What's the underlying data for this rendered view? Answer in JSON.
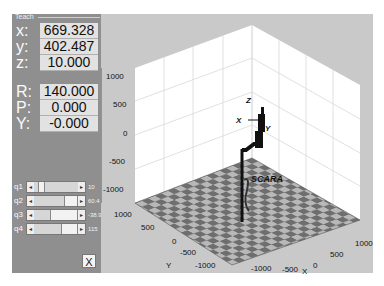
{
  "panel": {
    "title": "Teach",
    "position": [
      {
        "label": "x:",
        "value": "669.328"
      },
      {
        "label": "y:",
        "value": "402.487"
      },
      {
        "label": "z:",
        "value": "10.000"
      }
    ],
    "orientation": [
      {
        "label": "R:",
        "value": "140.000"
      },
      {
        "label": "P:",
        "value": "0.000"
      },
      {
        "label": "Y:",
        "value": "-0.000"
      }
    ],
    "joints": [
      {
        "label": "q1",
        "value": "10",
        "thumb_left": 4,
        "thumb_width": 7
      },
      {
        "label": "q2",
        "value": "60.4",
        "thumb_left": 30,
        "thumb_width": 14
      },
      {
        "label": "q3",
        "value": "-38.9",
        "thumb_left": 16,
        "thumb_width": 28
      },
      {
        "label": "q4",
        "value": "115",
        "thumb_left": 27,
        "thumb_width": 17
      }
    ],
    "close_label": "X"
  },
  "plot": {
    "robot_label": "SCARA",
    "frame_labels": {
      "x": "X",
      "y": "Y",
      "z": "Z"
    },
    "z_ticks": [
      "1000",
      "500",
      "0",
      "-500",
      "-1000"
    ],
    "y_ticks": [
      "1000",
      "500",
      "0",
      "-500",
      "-1000"
    ],
    "x_ticks": [
      "1000",
      "500",
      "0",
      "-500",
      "-1000"
    ],
    "y_axis_label": "Y",
    "x_axis_label": "X"
  }
}
